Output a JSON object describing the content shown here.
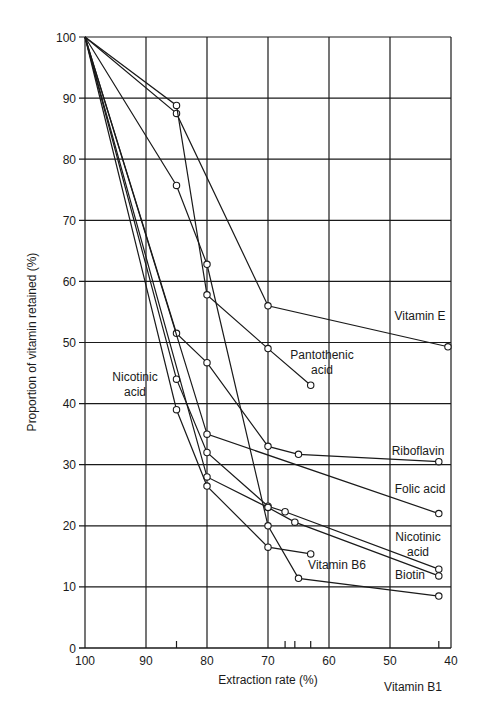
{
  "chart_data": {
    "type": "line",
    "title": "",
    "xlabel": "Extraction rate (%)",
    "ylabel": "Proportion of vitamin retained (%)",
    "xlim": [
      100,
      40
    ],
    "ylim": [
      0,
      100
    ],
    "x_reversed": true,
    "grid": true,
    "legend_position": "inline labels",
    "x_ticks": [
      100,
      90,
      80,
      70,
      60,
      50,
      40
    ],
    "y_ticks": [
      0,
      10,
      20,
      30,
      40,
      50,
      60,
      70,
      80,
      90,
      100
    ],
    "x_minor_marks": [
      85,
      67.2,
      65.6,
      63,
      42
    ],
    "series": [
      {
        "name": "Vitamin E",
        "points": [
          [
            100,
            100
          ],
          [
            85,
            87.5
          ],
          [
            70,
            56
          ],
          [
            40.5,
            49.3
          ]
        ],
        "label_pos": [
          420,
          320
        ]
      },
      {
        "name": "Pantothenic acid",
        "points": [
          [
            100,
            100
          ],
          [
            85,
            88.8
          ],
          [
            80,
            57.8
          ],
          [
            70,
            49
          ],
          [
            63,
            43
          ]
        ],
        "label_lines": [
          "Pantothenic",
          "acid"
        ],
        "label_pos": [
          322,
          359
        ]
      },
      {
        "name": "Vitamin B1",
        "points": [
          [
            100,
            100
          ],
          [
            85,
            75.7
          ],
          [
            80,
            62.8
          ],
          [
            70,
            20
          ],
          [
            65,
            11.4
          ],
          [
            42,
            8.5
          ]
        ],
        "label_pos": [
          413,
          691
        ]
      },
      {
        "name": "Riboflavin",
        "points": [
          [
            100,
            100
          ],
          [
            85,
            51.5
          ],
          [
            80,
            46.7
          ],
          [
            70,
            33
          ],
          [
            65,
            31.7
          ],
          [
            42,
            30.5
          ]
        ],
        "label_pos": [
          418,
          455
        ]
      },
      {
        "name": "Folic acid",
        "points": [
          [
            100,
            100
          ],
          [
            80,
            35
          ],
          [
            42,
            22
          ]
        ],
        "label_pos": [
          420,
          493
        ]
      },
      {
        "name": "Nicotinic acid",
        "points": [
          [
            100,
            100
          ],
          [
            85,
            44
          ],
          [
            80,
            32
          ],
          [
            70,
            23.2
          ],
          [
            67.2,
            22.3
          ],
          [
            42,
            12.9
          ]
        ],
        "label_lines": [
          "Nicotinic",
          "acid"
        ],
        "label_pos": [
          418,
          541
        ]
      },
      {
        "name": "Biotin",
        "points": [
          [
            100,
            100
          ],
          [
            80,
            28
          ],
          [
            70,
            23
          ],
          [
            65.6,
            20.6
          ],
          [
            42,
            11.8
          ]
        ],
        "label_pos": [
          410,
          579
        ]
      },
      {
        "name": "Vitamin B6",
        "points": [
          [
            100,
            100
          ],
          [
            85,
            39
          ],
          [
            80,
            26.5
          ],
          [
            70,
            16.5
          ],
          [
            63,
            15.4
          ]
        ],
        "label_pos": [
          337,
          569
        ]
      }
    ],
    "annotations": [
      {
        "text_lines": [
          "Nicotinic",
          "acid"
        ],
        "pos": [
          135,
          381
        ],
        "refers_to": "Nicotinic acid"
      }
    ]
  },
  "axis": {
    "xlabel": "Extraction rate (%)",
    "ylabel": "Proportion of vitamin retained (%)"
  },
  "style": {
    "line_color": "#1a1a1a",
    "grid_color": "#1a1a1a",
    "background": "#ffffff"
  }
}
